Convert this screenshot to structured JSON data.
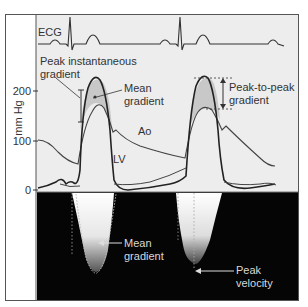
{
  "figure": {
    "ecg_label": "ECG",
    "y_axis": {
      "label": "mm Hg",
      "ticks": [
        "200",
        "100",
        "0"
      ]
    },
    "curve_labels": {
      "aorta": "Ao",
      "left_ventricle": "LV"
    },
    "annotations": {
      "peak_instantaneous_line1": "Peak instantaneous",
      "peak_instantaneous_line2": "gradient",
      "mean_gradient_top_line1": "Mean",
      "mean_gradient_top_line2": "gradient",
      "peak_to_peak_line1": "Peak-to-peak",
      "peak_to_peak_line2": "gradient",
      "mean_gradient_doppler_line1": "Mean",
      "mean_gradient_doppler_line2": "gradient",
      "peak_velocity_line1": "Peak",
      "peak_velocity_line2": "velocity"
    },
    "colors": {
      "panel_background": "#ededed",
      "doppler_background": "#050505",
      "shaded_gradient": "#c8c8c8",
      "line": "#333333",
      "frame": "#555555"
    }
  }
}
